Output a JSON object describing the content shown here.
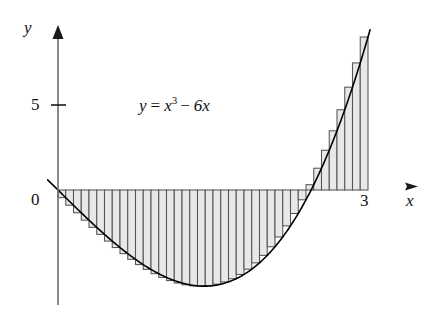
{
  "chart_data": {
    "type": "area",
    "title": "",
    "subtitle": "",
    "function_label": "y = x³ − 6x",
    "function_parts": {
      "lhs": "y",
      "equals": "=",
      "base": "x",
      "exponent": "3",
      "minus": "−",
      "linear_term": "6x"
    },
    "expression": "x^3 - 6x",
    "xlabel": "x",
    "ylabel": "y",
    "xlim": [
      -0.12,
      3.55
    ],
    "ylim": [
      -6.6,
      10.6
    ],
    "x_ticks": [
      {
        "value": 3,
        "label": "3"
      }
    ],
    "y_ticks": [
      {
        "value": 5,
        "label": "5"
      },
      {
        "value": 0,
        "label": "0"
      }
    ],
    "origin_label": "0",
    "grid": false,
    "legend": null,
    "axis_arrows": {
      "x": true,
      "y": true
    },
    "riemann": {
      "type": "right-endpoint",
      "n": 40,
      "a": 0,
      "b": 3,
      "dx": 0.075,
      "fill_color": "#e8e8e8",
      "edge_color": "#555555"
    },
    "curve": {
      "color": "#000000",
      "x": [
        0,
        0.15,
        0.3,
        0.45,
        0.6,
        0.75,
        0.9,
        1.05,
        1.2,
        1.35,
        1.414,
        1.5,
        1.65,
        1.8,
        1.95,
        2.1,
        2.25,
        2.449,
        2.6,
        2.75,
        2.9,
        3
      ],
      "y": [
        0,
        -0.897,
        -1.773,
        -2.609,
        -3.384,
        -4.078,
        -4.671,
        -5.142,
        -5.472,
        -5.639,
        -5.657,
        -5.625,
        -5.407,
        -4.968,
        -4.286,
        -3.339,
        -2.109,
        0,
        2.976,
        4.297,
        7.989,
        9
      ]
    },
    "key_points": {
      "root_left": {
        "x": 0,
        "y": 0
      },
      "minimum": {
        "x": 1.4142,
        "y": -5.657
      },
      "root_right": {
        "x": 2.4495,
        "y": 0
      },
      "endpoint": {
        "x": 3,
        "y": 9
      }
    }
  },
  "labels": {
    "y_axis": "y",
    "x_axis": "x",
    "tick_five": "5",
    "tick_zero": "0",
    "tick_three": "3"
  }
}
